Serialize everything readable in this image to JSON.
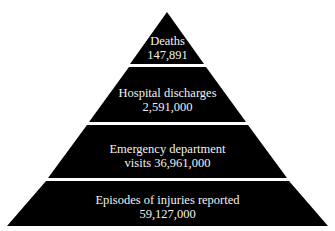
{
  "diagram": {
    "type": "pyramid",
    "colors": {
      "band": "#000000",
      "text": "#f2f2f2",
      "background": "#ffffff"
    },
    "levels": [
      {
        "title": "Deaths",
        "value": "147,891"
      },
      {
        "title": "Hospital discharges",
        "value": "2,591,000"
      },
      {
        "line1": "Emergency department",
        "line2": "visits 36,961,000"
      },
      {
        "title": "Episodes of injuries reported",
        "value": "59,127,000"
      }
    ]
  }
}
